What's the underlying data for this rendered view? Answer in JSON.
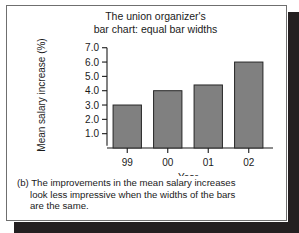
{
  "figure": {
    "title_line1": "The union organizer's",
    "title_line2": "bar chart: equal bar widths",
    "caption_label": "(b)",
    "caption_line1": "The improvements in the mean salary increases",
    "caption_line2": "look less impressive when the widths of the bars",
    "caption_line3": "are the same.",
    "bar_fill_color": "#808080",
    "bar_border_color": "#262626",
    "frame_color": "#6f6f6f",
    "shadow_color": "#231f20"
  },
  "chart_data": {
    "type": "bar",
    "title": "The union organizer's bar chart: equal bar widths",
    "categories": [
      "99",
      "00",
      "01",
      "02"
    ],
    "values": [
      3.0,
      4.0,
      4.4,
      6.0
    ],
    "xlabel": "Year",
    "ylabel": "Mean salary increase (%)",
    "ylim": [
      0,
      7.4
    ],
    "yticks": [
      1.0,
      2.0,
      3.0,
      4.0,
      5.0,
      6.0,
      7.0
    ],
    "ytick_labels": [
      "1.0",
      "2.0",
      "3.0",
      "4.0",
      "5.0",
      "6.0",
      "7.0"
    ],
    "grid": false,
    "legend": null,
    "equal_bar_widths": true
  }
}
